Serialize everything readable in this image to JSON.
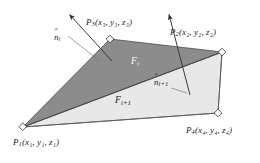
{
  "figure": {
    "background_color": "#ffffff",
    "colors": {
      "face_i_fill": "#8c8c8c",
      "face_i_plus_1_fill": "#e8e8e8",
      "edge_stroke": "#4a4a4a",
      "arrow_stroke": "#3a3a3a",
      "vertex_marker_fill": "#ffffff",
      "vertex_marker_stroke": "#3a3a3a",
      "label_dark": "#1d1d1d",
      "label_light": "#fafafa"
    },
    "vertices": [
      {
        "id": "P1",
        "label_prefix": "P",
        "index": "1",
        "label_text": "P₁(x₁, y₁, z₁)",
        "coords_text": "(x1, y1, z1)",
        "x": 23,
        "y": 127
      },
      {
        "id": "P2",
        "label_prefix": "P",
        "index": "2",
        "label_text": "P₂(x₂, y₂, z₂)",
        "coords_text": "(x2, y2, z2)",
        "x": 222,
        "y": 52
      },
      {
        "id": "P3",
        "label_prefix": "P",
        "index": "3",
        "label_text": "P₃(x₃, y₃, z₃)",
        "coords_text": "(x3, y3, z3)",
        "x": 110,
        "y": 39
      },
      {
        "id": "P4",
        "label_prefix": "P",
        "index": "4",
        "label_text": "P₄(x₄, y₄, z₄)",
        "coords_text": "(x4, y4, z4)",
        "x": 218,
        "y": 113
      }
    ],
    "faces": [
      {
        "id": "F_i",
        "label_text": "F",
        "subscript": "i",
        "fill": "#8c8c8c",
        "vertex_ids": [
          "P1",
          "P3",
          "P2"
        ]
      },
      {
        "id": "F_i_plus_1",
        "label_text": "F",
        "subscript": "i+1",
        "fill": "#e8e8e8",
        "vertex_ids": [
          "P1",
          "P2",
          "P4"
        ]
      }
    ],
    "normals": [
      {
        "id": "n_i",
        "label_text": "n",
        "subscript": "i",
        "accent": "hat",
        "tail_x": 112,
        "tail_y": 61,
        "head_x": 67,
        "head_y": 12
      },
      {
        "id": "n_i_plus_1",
        "label_text": "n",
        "subscript": "i+1",
        "accent": "hat",
        "tail_x": 190,
        "tail_y": 95,
        "head_x": 167,
        "head_y": 12
      }
    ],
    "labels": {
      "p1": {
        "base": "P",
        "sub": "1",
        "coords": "(x₁, y₁, z₁)"
      },
      "p2": {
        "base": "P",
        "sub": "2",
        "coords": "(x₂, y₂, z₂)"
      },
      "p3": {
        "base": "P",
        "sub": "3",
        "coords": "(x₃, y₃, z₃)"
      },
      "p4": {
        "base": "P",
        "sub": "4",
        "coords": "(x₄, y₄, z₄)"
      },
      "face_i": {
        "base": "F",
        "sub": "i"
      },
      "face_i_plus_1": {
        "base": "F",
        "sub": "i+1"
      },
      "normal_i": {
        "base": "n",
        "sub": "i",
        "hat": "ˆ"
      },
      "normal_i_plus_1": {
        "base": "n",
        "sub": "i+1",
        "hat": "ˆ"
      }
    }
  }
}
